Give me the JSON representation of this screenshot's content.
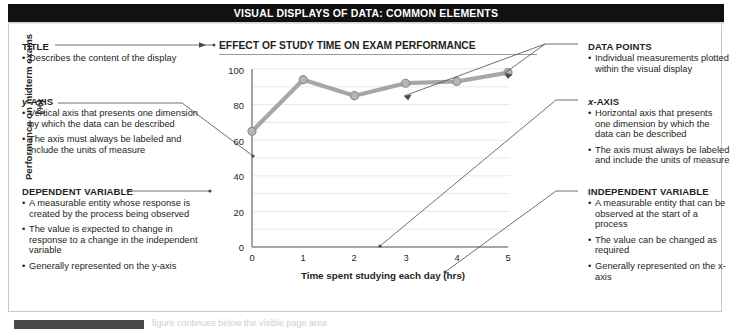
{
  "header": {
    "title": "VISUAL DISPLAYS OF DATA: COMMON ELEMENTS"
  },
  "bottom": {
    "cut_text": "figure continues below the visible page area"
  },
  "callouts": {
    "left": [
      {
        "id": "title",
        "heading": "TITLE",
        "bullets": [
          "Describes the content of the display"
        ]
      },
      {
        "id": "y-axis",
        "heading": "y-AXIS",
        "heading_italic_prefix": "y",
        "heading_rest": "-AXIS",
        "bullets": [
          "Vertical axis that presents one dimension by which the data can be described",
          "The axis must always be labeled and include the units of measure"
        ]
      },
      {
        "id": "dependent-variable",
        "heading": "DEPENDENT VARIABLE",
        "bullets": [
          "A measurable entity whose response is created by the process being observed",
          "The value is expected to change in response to a change in the independent variable",
          "Generally represented on the y-axis"
        ]
      }
    ],
    "right": [
      {
        "id": "data-points",
        "heading": "DATA POINTS",
        "bullets": [
          "Individual measurements plotted within the visual display"
        ]
      },
      {
        "id": "x-axis",
        "heading": "x-AXIS",
        "heading_italic_prefix": "x",
        "heading_rest": "-AXIS",
        "bullets": [
          "Horizontal axis that presents one dimension by which the data can be described",
          "The axis must always be labeled and include the units of measure"
        ]
      },
      {
        "id": "independent-variable",
        "heading": "INDEPENDENT VARIABLE",
        "bullets": [
          "A measurable entity that can be observed at the start of a process",
          "The value can be changed as required",
          "Generally represented on the x-axis"
        ]
      }
    ]
  },
  "chart_data": {
    "type": "line",
    "title": "EFFECT OF STUDY TIME ON EXAM PERFORMANCE",
    "xlabel": "Time spent studying each day (hrs)",
    "ylabel": "Performance on midterm exams (%)",
    "x": [
      0,
      1,
      2,
      3,
      4,
      5
    ],
    "values": [
      65,
      94,
      85,
      92,
      93,
      98
    ],
    "series": [
      {
        "name": "Performance on midterm exams (%)",
        "values": [
          65,
          94,
          85,
          92,
          93,
          98
        ]
      }
    ],
    "xlim": [
      0,
      5
    ],
    "ylim": [
      0,
      100
    ],
    "xticks": [
      "0",
      "1",
      "2",
      "3",
      "4",
      "5"
    ],
    "yticks": [
      "0",
      "20",
      "40",
      "60",
      "80",
      "100"
    ],
    "grid": true,
    "grid_step": 10,
    "legend": "none",
    "line_color": "#a6a6a6",
    "marker_color": "#b5b5b5",
    "marker_edge_color": "#8f8f8f",
    "axis_color": "#8c8c8c",
    "gridline_color": "#e8e8e8"
  },
  "colors": {
    "header_bg": "#111111",
    "header_text": "#ffffff",
    "body_text": "#231f20",
    "frame_border": "#c8c8c8",
    "leader_line": "#4a4a4a"
  }
}
